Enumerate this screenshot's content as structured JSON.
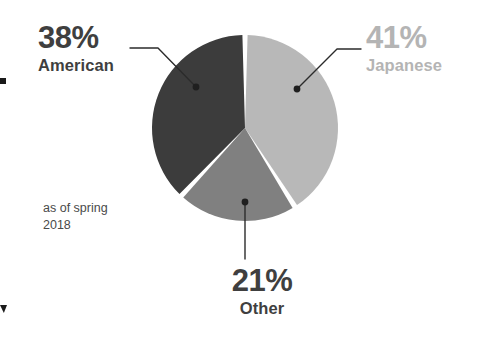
{
  "chart_data": {
    "type": "pie",
    "title": "",
    "subtitle": "",
    "legend_position": "callouts",
    "grid": false,
    "categories": [
      "Japanese",
      "Other",
      "American"
    ],
    "values": [
      41,
      21,
      38
    ],
    "value_suffix": "%",
    "slices": [
      {
        "label": "Japanese",
        "value": 41,
        "display_value": "41%",
        "color": "#b8b8b8",
        "start_angle_deg": 0,
        "end_angle_deg": 147.6,
        "label_color": "#b4b4b4"
      },
      {
        "label": "Other",
        "value": 21,
        "display_value": "21%",
        "color": "#808080",
        "start_angle_deg": 147.6,
        "end_angle_deg": 223.2,
        "label_color": "#3f3f3f"
      },
      {
        "label": "American",
        "value": 38,
        "display_value": "38%",
        "color": "#3c3c3c",
        "start_angle_deg": 223.2,
        "end_angle_deg": 360,
        "label_color": "#3f3f3f"
      }
    ],
    "annotations": [
      "as of spring",
      "2018"
    ],
    "xlabel": "",
    "ylabel": ""
  },
  "callouts": {
    "american": {
      "percent": "38%",
      "category": "American"
    },
    "japanese": {
      "percent": "41%",
      "category": "Japanese"
    },
    "other": {
      "percent": "21%",
      "category": "Other"
    }
  },
  "note": {
    "line1": "as of spring",
    "line2": "2018"
  },
  "colors": {
    "american_slice": "#3c3c3c",
    "japanese_slice": "#b8b8b8",
    "other_slice": "#808080",
    "leader_line": "#2b2b2b",
    "background": "#ffffff",
    "separator": "#ffffff"
  }
}
